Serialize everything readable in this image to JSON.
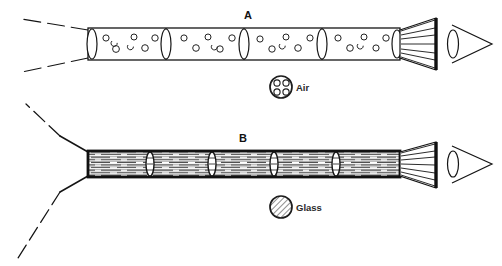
{
  "figure": {
    "background_color": "#ffffff",
    "ink_color": "#111111",
    "width": 502,
    "height": 266
  },
  "diagrams": [
    {
      "id": "A",
      "label": "A",
      "label_x": 248,
      "label_y": 19,
      "medium": "Air",
      "tube": {
        "x": 88,
        "y": 28,
        "width": 312,
        "height": 32,
        "stroke_width": 1.2,
        "fill": "#ffffff",
        "segment_count": 4,
        "segment_dividers_x": [
          166,
          244,
          322
        ],
        "lens_positions_x": [
          92,
          166,
          244,
          322,
          398
        ],
        "bubble_count": 22
      },
      "rays": {
        "style": "dashed",
        "count": 2,
        "origin_x": 88,
        "upper_end": [
          22,
          19
        ],
        "lower_end": [
          22,
          72
        ]
      },
      "funnel": {
        "x": 400,
        "top_y": 18,
        "bottom_y": 70,
        "throat_y_top": 30,
        "throat_y_bottom": 58,
        "width": 36,
        "ray_count": 7
      },
      "eye": {
        "cx": 470,
        "cy": 44,
        "width": 42,
        "height": 40
      }
    },
    {
      "id": "B",
      "label": "B",
      "label_x": 243,
      "label_y": 142,
      "medium": "Glass",
      "tube": {
        "x": 88,
        "y": 151,
        "width": 312,
        "height": 26,
        "stroke_width": 2.6,
        "fill": "#ffffff",
        "segment_count": 5,
        "segment_dividers_x": [
          150,
          212,
          274,
          336
        ],
        "lens_positions_x": [
          150,
          212,
          274,
          336
        ],
        "hatch_spacing": 2.6
      },
      "rays": {
        "style": "solid-with-dashed-extension",
        "count": 2,
        "origin_x": 88,
        "upper_end": [
          60,
          136
        ],
        "lower_end": [
          60,
          192
        ],
        "dashed_upper_end": [
          26,
          104
        ],
        "dashed_lower_end": [
          18,
          258
        ]
      },
      "funnel": {
        "x": 400,
        "top_y": 142,
        "bottom_y": 188,
        "throat_y_top": 152,
        "throat_y_bottom": 176,
        "width": 36,
        "ray_count": 7
      },
      "eye": {
        "cx": 470,
        "cy": 164,
        "width": 42,
        "height": 40
      }
    }
  ],
  "legends": [
    {
      "id": "air",
      "label": "Air",
      "symbol": "circle-with-bubbles",
      "cx": 281,
      "cy": 87,
      "r": 11,
      "label_x": 296,
      "label_y": 91,
      "bubble_count": 4
    },
    {
      "id": "glass",
      "label": "Glass",
      "symbol": "circle-with-hatching",
      "cx": 281,
      "cy": 207,
      "r": 11,
      "label_x": 296,
      "label_y": 211,
      "hatch_angle_deg": 45
    }
  ]
}
